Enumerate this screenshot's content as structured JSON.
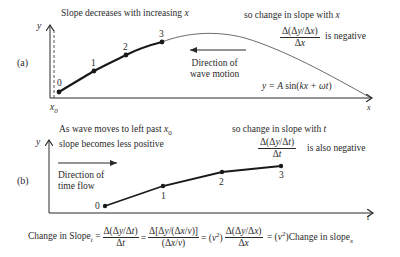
{
  "panel_a": {
    "label": "(a)",
    "title": "Slope decreases with increasing x",
    "y_axis_label": "y",
    "x_axis_label": "x",
    "x0_label": "x0",
    "right_note_line1": "so change in slope with x",
    "fraction_num": "Δ(Δy/Δx)",
    "fraction_den": "Δx",
    "fraction_suffix": "is negative",
    "direction_line1": "Direction of",
    "direction_line2": "wave motion",
    "equation": "y = A sin(kx + ωt)",
    "points": [
      {
        "label": "0",
        "x": 59,
        "y": 92
      },
      {
        "label": "1",
        "x": 94,
        "y": 71
      },
      {
        "label": "2",
        "x": 126,
        "y": 55
      },
      {
        "label": "3",
        "x": 162,
        "y": 42
      }
    ]
  },
  "panel_b": {
    "label": "(b)",
    "note_line1": "As wave moves to left past x0",
    "note_line2": "slope becomes less positive",
    "y_axis_label": "y",
    "t_axis_label": "t",
    "right_note_line1": "so change in slope with t",
    "fraction_num": "Δ(Δy/Δt)",
    "fraction_den": "Δt",
    "fraction_suffix": "is also negative",
    "direction_line1": "Direction of",
    "direction_line2": "time flow",
    "points": [
      {
        "label": "0",
        "x": 105,
        "y": 206
      },
      {
        "label": "1",
        "x": 163,
        "y": 186
      },
      {
        "label": "2",
        "x": 222,
        "y": 172
      },
      {
        "label": "3",
        "x": 281,
        "y": 166
      }
    ]
  },
  "equation_bottom": {
    "lhs": "Change in Slope",
    "lhs_sub": "t",
    "f1_num": "Δ(Δy/Δt)",
    "f1_den": "Δt",
    "f2_num": "Δ[Δy/(Δx/v)]",
    "f2_den": "(Δx/v)",
    "v2": "(v²)",
    "f3_num": "Δ(Δy/Δx)",
    "f3_den": "Δx",
    "rhs": "(v²)Change in slope",
    "rhs_sub": "x"
  }
}
